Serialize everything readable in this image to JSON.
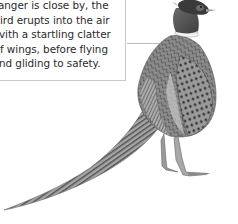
{
  "caption": {
    "lines": [
      "anger is close by, the",
      "ird erupts into the air",
      "vith a startling clatter",
      "f wings, before flying",
      "nd gliding to safety."
    ]
  },
  "illustration": {
    "subject": "pheasant",
    "style": "grayscale"
  },
  "colors": {
    "text": "#2a2a2a",
    "border": "#c9c9c9",
    "leader_line": "#bdbdbd",
    "background": "#ffffff"
  }
}
